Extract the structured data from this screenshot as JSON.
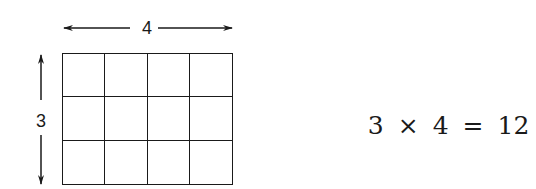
{
  "diagram": {
    "grid": {
      "rows": 3,
      "columns": 4,
      "cells": 12
    },
    "width_label": "4",
    "height_label": "3",
    "equation": {
      "left_operand": "3",
      "operator": "×",
      "right_operand": "4",
      "equals": "=",
      "result": "12"
    },
    "colors": {
      "stroke": "#1a1a1a",
      "background": "#ffffff"
    }
  }
}
